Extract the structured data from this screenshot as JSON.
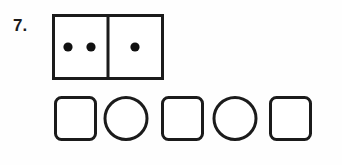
{
  "item": {
    "number_label": "7.",
    "ink_color": "#1b1b1b",
    "page_background": "#fefefe"
  },
  "domino": {
    "name": "domino-tile",
    "left_half_dots": 2,
    "right_half_dots": 1,
    "total_dots": 3,
    "border_color": "#1b1b1b",
    "dot_color": "#111111",
    "fill_color": "#ffffff",
    "stroke_width": 3,
    "dot_radius": 4.6,
    "tile": {
      "x": 0,
      "y": 0,
      "width": 112,
      "height": 66
    },
    "divider_x": 56,
    "left_dot_centers": [
      {
        "cx": 16,
        "cy": 33
      },
      {
        "cx": 39,
        "cy": 33
      }
    ],
    "right_dot_centers": [
      {
        "cx": 83,
        "cy": 33
      }
    ]
  },
  "shape_row": {
    "name": "answer-shape-row",
    "count": 5,
    "pattern": "square, circle, square, circle, square",
    "stroke_color": "#1b1b1b",
    "fill_color": "#ffffff",
    "stroke_width": 3,
    "shapes": [
      {
        "index": 1,
        "kind": "rounded-square",
        "label": "square",
        "x": 1,
        "y": 1,
        "width": 42,
        "height": 44,
        "corner_radius": 6
      },
      {
        "index": 2,
        "kind": "circle",
        "label": "circle",
        "cx": 73,
        "cy": 23,
        "rx": 22,
        "ry": 22
      },
      {
        "index": 3,
        "kind": "rounded-square",
        "label": "square",
        "x": 108,
        "y": 1,
        "width": 42,
        "height": 44,
        "corner_radius": 6
      },
      {
        "index": 4,
        "kind": "circle",
        "label": "circle",
        "cx": 182,
        "cy": 23,
        "rx": 22,
        "ry": 22
      },
      {
        "index": 5,
        "kind": "rounded-square",
        "label": "square",
        "x": 216,
        "y": 1,
        "width": 42,
        "height": 44,
        "corner_radius": 6
      }
    ]
  }
}
